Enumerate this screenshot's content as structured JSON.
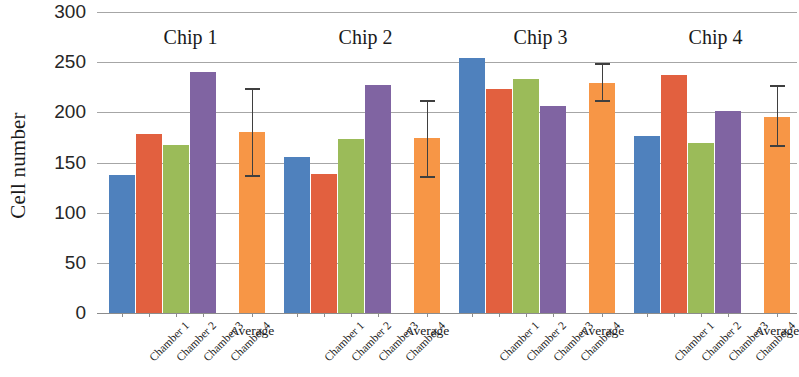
{
  "chart_data": {
    "type": "bar",
    "title": "",
    "xlabel": "",
    "ylabel": "Cell number",
    "ylim": [
      0,
      300
    ],
    "ytick_values": [
      300,
      250,
      200,
      150,
      100,
      50,
      0
    ],
    "ytick_labels": [
      "300",
      "250",
      "200",
      "150",
      "100",
      "50",
      "0"
    ],
    "grid": true,
    "legend": "none",
    "categories": [
      "Chamber 1",
      "Chamber 2",
      "Chamber 3",
      "Chamber 4",
      "Average"
    ],
    "average_label": "Average",
    "groups": [
      {
        "name": "Chip 1",
        "values": [
          138,
          178,
          167,
          240
        ],
        "average": 180,
        "error_low": 138,
        "error_high": 224,
        "error": 43
      },
      {
        "name": "Chip 2",
        "values": [
          155,
          139,
          173,
          227
        ],
        "average": 174,
        "error_low": 137,
        "error_high": 212,
        "error": 37
      },
      {
        "name": "Chip 3",
        "values": [
          254,
          223,
          233,
          206
        ],
        "average": 229,
        "error_low": 212,
        "error_high": 249,
        "error": 19
      },
      {
        "name": "Chip 4",
        "values": [
          176,
          237,
          169,
          201
        ],
        "average": 195,
        "error_low": 167,
        "error_high": 227,
        "error": 30
      }
    ],
    "series_colors": {
      "chamber_1": "#4f81bd",
      "chamber_2": "#e2603f",
      "chamber_3": "#9bbb59",
      "chamber_4": "#8064a2",
      "average": "#f79646"
    },
    "gridline_color": "#a6a6a6",
    "errorbar_color": "#3f3f3f",
    "background": "#ffffff"
  }
}
